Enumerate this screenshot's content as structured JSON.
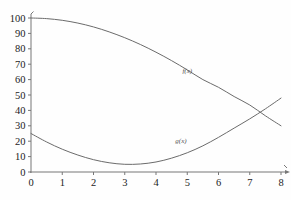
{
  "chart_data": {
    "type": "line",
    "title": "",
    "subtitle": "",
    "xlabel": "",
    "ylabel": "",
    "xlim": [
      0,
      8
    ],
    "ylim": [
      0,
      100
    ],
    "grid": false,
    "legend_position": "inline-annotation",
    "xticks": [
      "0",
      "1",
      "2",
      "3",
      "4",
      "5",
      "6",
      "7",
      "8"
    ],
    "xtick_values": [
      0,
      1,
      2,
      3,
      4,
      5,
      6,
      7,
      8
    ],
    "yticks": [
      "0",
      "10",
      "20",
      "30",
      "40",
      "50",
      "60",
      "70",
      "80",
      "90",
      "100"
    ],
    "ytick_values": [
      0,
      10,
      20,
      30,
      40,
      50,
      60,
      70,
      80,
      90,
      100
    ],
    "x": [
      0,
      0.5,
      1,
      1.5,
      2,
      2.5,
      3,
      3.5,
      4,
      4.5,
      5,
      5.5,
      6,
      6.5,
      7,
      7.5,
      8
    ],
    "series": [
      {
        "name": "f(x)",
        "label": "f(x)",
        "color": "#6b6b6b",
        "values": [
          100,
          99.6,
          98.5,
          96.7,
          94.2,
          91.0,
          87.2,
          82.8,
          77.8,
          72.3,
          66.3,
          60.0,
          55.0,
          49.0,
          43.5,
          36.5,
          30.0
        ]
      },
      {
        "name": "g(x)",
        "label": "g(x)",
        "color": "#6b6b6b",
        "values": [
          25,
          19.5,
          14.8,
          11.0,
          8.0,
          6.0,
          5.0,
          5.2,
          6.5,
          9.0,
          12.5,
          17.0,
          22.5,
          28.5,
          34.5,
          41.0,
          48.0
        ]
      }
    ],
    "annotations": [
      {
        "text": "f(x)",
        "x": 5.0,
        "y": 64
      },
      {
        "text": "g(x)",
        "x": 4.8,
        "y": 19
      }
    ],
    "axis_color": "#777777",
    "background_color": "#fefefe"
  }
}
